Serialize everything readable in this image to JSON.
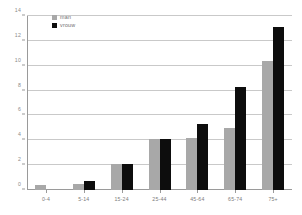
{
  "chart_data": {
    "type": "bar",
    "title": "",
    "subtitle": "",
    "xlabel": "",
    "ylabel": "",
    "categories": [
      "0-4",
      "5-14",
      "15-24",
      "25-44",
      "45-64",
      "65-74",
      "75+"
    ],
    "series": [
      {
        "name": "man",
        "color": "#a8a8a8",
        "values": [
          0.4,
          0.5,
          2.1,
          4.1,
          4.2,
          5.0,
          10.4
        ]
      },
      {
        "name": "vrouw",
        "color": "#0d0d0d",
        "values": [
          0.0,
          0.7,
          2.1,
          4.1,
          5.3,
          8.3,
          13.1
        ]
      }
    ],
    "ylim": [
      0,
      14
    ],
    "yticks": [
      0,
      2,
      4,
      6,
      8,
      10,
      12,
      14
    ],
    "ytick_labels": [
      "0",
      "2",
      "4",
      "6",
      "8",
      "10",
      "12",
      "14"
    ],
    "grid": true,
    "grid_axis": "y",
    "legend_position": "top-left",
    "legend": [
      "man",
      "vrouw"
    ],
    "annotations": []
  },
  "colors": {
    "man": "#a8a8a8",
    "vrouw": "#0d0d0d",
    "gridline": "#c9c9c9",
    "axis": "#9a9a9a",
    "tick_text": "#7c7c7c",
    "background": "#ffffff"
  }
}
